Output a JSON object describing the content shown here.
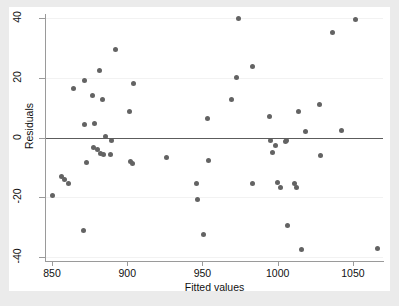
{
  "figure": {
    "background_color": "#ebebeb",
    "canvas_color": "#ffffff",
    "marker_color": "#636363",
    "axis_color": "#9a9a9a",
    "zeroline_color": "#5c5c5c",
    "gridline_color": "#f2f2f2"
  },
  "chart_data": {
    "type": "scatter",
    "title": "",
    "xlabel": "Fitted values",
    "ylabel": "Residuals",
    "xlim": [
      846,
      1070
    ],
    "ylim": [
      -41,
      41
    ],
    "xticks": [
      850,
      900,
      950,
      1000,
      1050
    ],
    "yticks": [
      -40,
      -20,
      0,
      20,
      40
    ],
    "xtick_labels": [
      "850",
      "900",
      "950",
      "1000",
      "1050"
    ],
    "ytick_labels": [
      "-40",
      "-20",
      "0",
      "20",
      "40"
    ],
    "grid": true,
    "grid_axis": "y",
    "legend": null,
    "reference_line": {
      "type": "horizontal",
      "y": 0
    },
    "marker": {
      "shape": "circle",
      "size": 5,
      "color": "#636363"
    },
    "n_points": 56,
    "points": [
      {
        "x": 850.0,
        "y": -19.4
      },
      {
        "x": 856.5,
        "y": -13.1
      },
      {
        "x": 858.5,
        "y": -14.0
      },
      {
        "x": 861.1,
        "y": -15.4
      },
      {
        "x": 864.4,
        "y": 16.5
      },
      {
        "x": 871.0,
        "y": -31.1
      },
      {
        "x": 871.4,
        "y": 19.0
      },
      {
        "x": 871.8,
        "y": 4.3
      },
      {
        "x": 872.8,
        "y": -8.5
      },
      {
        "x": 876.7,
        "y": 14.0
      },
      {
        "x": 877.4,
        "y": -3.4
      },
      {
        "x": 878.3,
        "y": 4.6
      },
      {
        "x": 880.1,
        "y": -4.0
      },
      {
        "x": 881.7,
        "y": 22.3
      },
      {
        "x": 882.5,
        "y": -5.2
      },
      {
        "x": 883.5,
        "y": 12.8
      },
      {
        "x": 883.9,
        "y": -5.6
      },
      {
        "x": 885.8,
        "y": 0.4
      },
      {
        "x": 889.1,
        "y": -5.8
      },
      {
        "x": 889.4,
        "y": -0.9
      },
      {
        "x": 892.4,
        "y": 29.4
      },
      {
        "x": 901.5,
        "y": 8.8
      },
      {
        "x": 902.4,
        "y": -8.1
      },
      {
        "x": 903.7,
        "y": -8.6
      },
      {
        "x": 904.1,
        "y": 18.2
      },
      {
        "x": 926.1,
        "y": -6.6
      },
      {
        "x": 946.2,
        "y": -15.3
      },
      {
        "x": 946.9,
        "y": -20.8
      },
      {
        "x": 950.7,
        "y": -32.3
      },
      {
        "x": 953.3,
        "y": 6.2
      },
      {
        "x": 953.7,
        "y": -7.6
      },
      {
        "x": 969.5,
        "y": 12.7
      },
      {
        "x": 972.5,
        "y": 20.1
      },
      {
        "x": 974.1,
        "y": 39.9
      },
      {
        "x": 983.0,
        "y": 23.9
      },
      {
        "x": 983.3,
        "y": -15.5
      },
      {
        "x": 994.7,
        "y": 6.9
      },
      {
        "x": 995.4,
        "y": -1.1
      },
      {
        "x": 996.7,
        "y": -5.0
      },
      {
        "x": 998.5,
        "y": -2.8
      },
      {
        "x": 1000.1,
        "y": -15.2
      },
      {
        "x": 1002.2,
        "y": -16.6
      },
      {
        "x": 1005.4,
        "y": -1.2
      },
      {
        "x": 1006.6,
        "y": -29.5
      },
      {
        "x": 1011.5,
        "y": -15.3
      },
      {
        "x": 1012.3,
        "y": -16.6
      },
      {
        "x": 1013.9,
        "y": 8.6
      },
      {
        "x": 1015.5,
        "y": -37.6
      },
      {
        "x": 1018.6,
        "y": 2.1
      },
      {
        "x": 1027.7,
        "y": 11.0
      },
      {
        "x": 1028.4,
        "y": -5.9
      },
      {
        "x": 1036.3,
        "y": 35.3
      },
      {
        "x": 1042.7,
        "y": 2.4
      },
      {
        "x": 1052.0,
        "y": 39.6
      },
      {
        "x": 1066.3,
        "y": -37.3
      },
      {
        "x": 1006.0,
        "y": -1.0
      }
    ]
  }
}
